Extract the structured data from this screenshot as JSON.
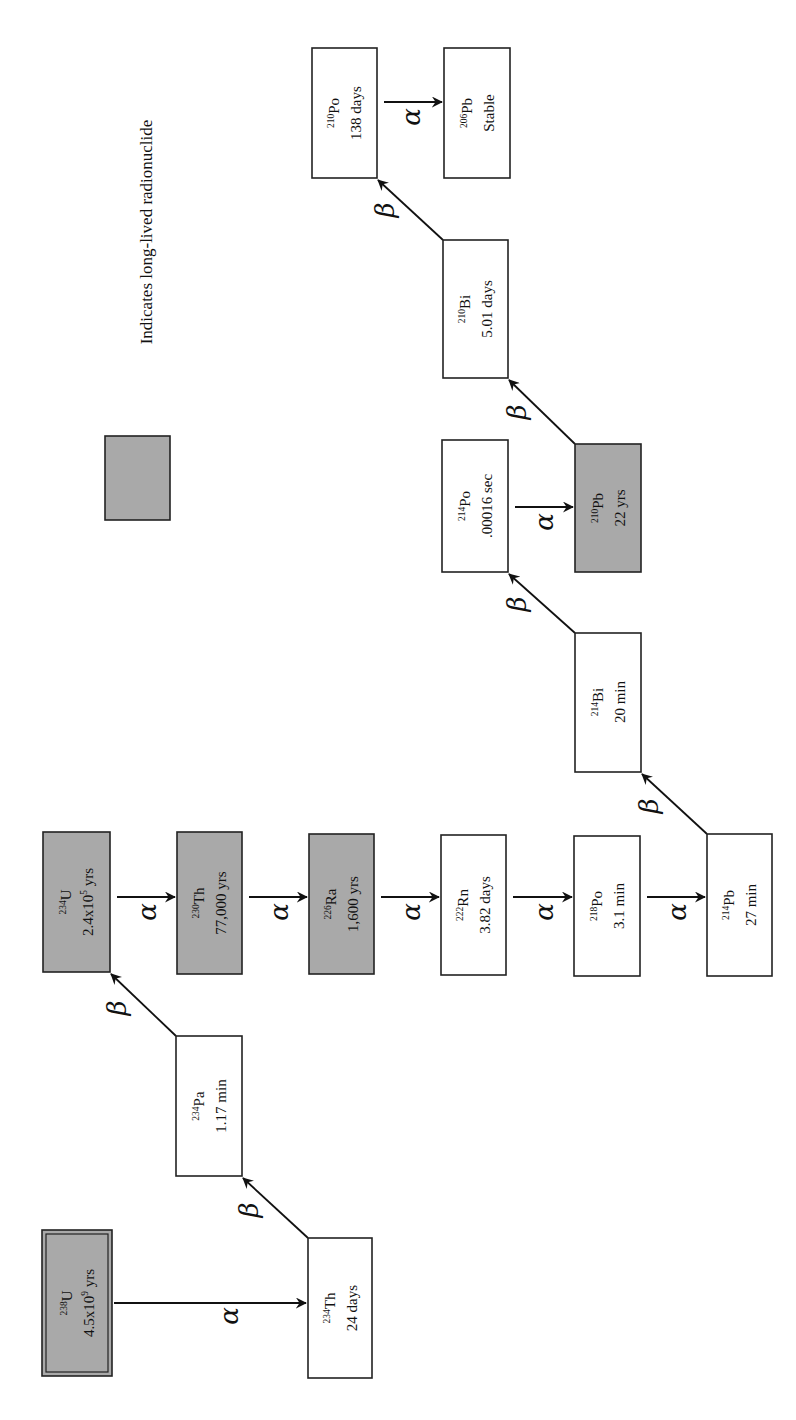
{
  "legend": {
    "label": "Indicates long-lived radionuclide",
    "swatch_color": "#a9a9a9"
  },
  "colors": {
    "long_lived_fill": "#a9a9a9",
    "short_lived_fill": "#ffffff",
    "stroke": "#222222"
  },
  "decay_symbols": {
    "alpha": "α",
    "beta": "β"
  },
  "nuclides": [
    {
      "id": "u238",
      "mass": "238",
      "symbol": "U",
      "half_life": "4.5x10",
      "half_life_exp": "9",
      "half_life_unit": " yrs",
      "long_lived": true,
      "primordial": true
    },
    {
      "id": "th234",
      "mass": "234",
      "symbol": "Th",
      "half_life": "24 days",
      "long_lived": false
    },
    {
      "id": "pa234",
      "mass": "234",
      "symbol": "Pa",
      "half_life": "1.17 min",
      "long_lived": false
    },
    {
      "id": "u234",
      "mass": "234",
      "symbol": "U",
      "half_life": "2.4x10",
      "half_life_exp": "5",
      "half_life_unit": " yrs",
      "long_lived": true
    },
    {
      "id": "th230",
      "mass": "230",
      "symbol": "Th",
      "half_life": "77,000 yrs",
      "long_lived": true
    },
    {
      "id": "ra226",
      "mass": "226",
      "symbol": "Ra",
      "half_life": "1,600 yrs",
      "long_lived": true
    },
    {
      "id": "rn222",
      "mass": "222",
      "symbol": "Rn",
      "half_life": "3.82 days",
      "long_lived": false
    },
    {
      "id": "po218",
      "mass": "218",
      "symbol": "Po",
      "half_life": "3.1 min",
      "long_lived": false
    },
    {
      "id": "pb214",
      "mass": "214",
      "symbol": "Pb",
      "half_life": "27 min",
      "long_lived": false
    },
    {
      "id": "bi214",
      "mass": "214",
      "symbol": "Bi",
      "half_life": "20 min",
      "long_lived": false
    },
    {
      "id": "po214",
      "mass": "214",
      "symbol": "Po",
      "half_life": ".00016 sec",
      "long_lived": false
    },
    {
      "id": "pb210",
      "mass": "210",
      "symbol": "Pb",
      "half_life": "22 yrs",
      "long_lived": true
    },
    {
      "id": "bi210",
      "mass": "210",
      "symbol": "Bi",
      "half_life": "5.01 days",
      "long_lived": false
    },
    {
      "id": "po210",
      "mass": "210",
      "symbol": "Po",
      "half_life": "138 days",
      "long_lived": false
    },
    {
      "id": "pb206",
      "mass": "206",
      "symbol": "Pb",
      "half_life": "Stable",
      "long_lived": false
    }
  ],
  "decays": [
    {
      "from": "u238",
      "to": "th234",
      "type": "alpha"
    },
    {
      "from": "th234",
      "to": "pa234",
      "type": "beta"
    },
    {
      "from": "pa234",
      "to": "u234",
      "type": "beta"
    },
    {
      "from": "u234",
      "to": "th230",
      "type": "alpha"
    },
    {
      "from": "th230",
      "to": "ra226",
      "type": "alpha"
    },
    {
      "from": "ra226",
      "to": "rn222",
      "type": "alpha"
    },
    {
      "from": "rn222",
      "to": "po218",
      "type": "alpha"
    },
    {
      "from": "po218",
      "to": "pb214",
      "type": "alpha"
    },
    {
      "from": "pb214",
      "to": "bi214",
      "type": "beta"
    },
    {
      "from": "bi214",
      "to": "po214",
      "type": "beta"
    },
    {
      "from": "po214",
      "to": "pb210",
      "type": "alpha"
    },
    {
      "from": "pb210",
      "to": "bi210",
      "type": "beta"
    },
    {
      "from": "bi210",
      "to": "po210",
      "type": "beta"
    },
    {
      "from": "po210",
      "to": "pb206",
      "type": "alpha"
    }
  ]
}
